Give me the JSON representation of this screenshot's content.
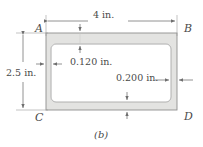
{
  "figure": {
    "caption": "(b)",
    "type": "engineering-cross-section-diagram",
    "corner_labels": {
      "top_left": "A",
      "top_right": "B",
      "bottom_left": "C",
      "bottom_right": "D"
    },
    "dimensions": {
      "width": "4 in.",
      "height": "2.5 in.",
      "thickness_thin": "0.120 in.",
      "thickness_thick": "0.200 in."
    },
    "colors": {
      "wall_fill": "#e3e3e1",
      "outline": "#8a8a8a",
      "dimension_line": "#6f6f6f",
      "text": "#4a4a4a",
      "background": "#ffffff"
    }
  }
}
